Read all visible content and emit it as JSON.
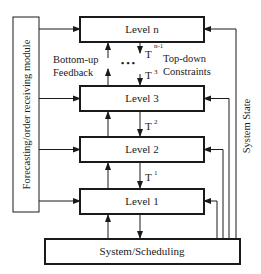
{
  "diagram": {
    "left_module": {
      "label": "Forecasting/order receiving module"
    },
    "levels": [
      {
        "id": "level-n",
        "label": "Level n"
      },
      {
        "id": "level-3",
        "label": "Level 3"
      },
      {
        "id": "level-2",
        "label": "Level 2"
      },
      {
        "id": "level-1",
        "label": "Level 1"
      }
    ],
    "bottom_module": {
      "label": "System/Scheduling"
    },
    "annotations": {
      "feedback_line1": "Bottom-up",
      "feedback_line2": "Feedback",
      "constraints_line1": "Top-down",
      "constraints_line2": "Constraints",
      "ellipsis": "• • •",
      "system_state": "System State"
    },
    "transfers": [
      {
        "base": "T",
        "sup": "n-1"
      },
      {
        "base": "T",
        "sup": "3"
      },
      {
        "base": "T",
        "sup": "2"
      },
      {
        "base": "T",
        "sup": "1"
      }
    ],
    "colors": {
      "stroke": "#1a1a1a",
      "background": "#ffffff"
    }
  }
}
